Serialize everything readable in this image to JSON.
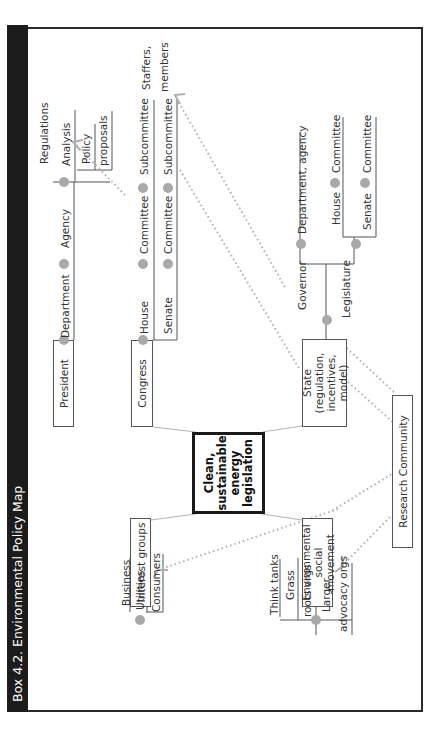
{
  "title": "Box 4.2. Environmental Policy Map",
  "center": {
    "label": "Clean, sustainable energy legislation",
    "lines": [
      "Clean,",
      "sustainable",
      "energy",
      "legislation"
    ]
  },
  "nodes": {
    "president": "President",
    "congress": "Congress",
    "state": {
      "lines": [
        "State (regulation,",
        "incentives,",
        "model)"
      ]
    },
    "interest_groups": "Interest groups",
    "env_movement": {
      "lines": [
        "Environmental",
        "social movement"
      ]
    },
    "research": "Research Community"
  },
  "federal_exec": {
    "department": "Department",
    "agency": "Agency",
    "regulations": "Regulations",
    "analysis": "Analysis",
    "policy_proposals": [
      "Policy",
      "proposals"
    ]
  },
  "congress_branch": {
    "house": "House",
    "senate": "Senate",
    "committee": "Committee",
    "subcommittee": "Subcommittee",
    "staffers": [
      "Staffers,",
      "members"
    ]
  },
  "state_branch": {
    "governor": "Governor",
    "dept_agency": "Department, agency",
    "legislature": "Legislature",
    "house": "House",
    "senate": "Senate",
    "committee": "Committee"
  },
  "interest_children": [
    "Business",
    "Utilities",
    "Consumers"
  ],
  "env_children": {
    "think_tanks": "Think tanks",
    "grass_roots": [
      "Grass",
      "roots orgs"
    ],
    "larger_advocacy": [
      "Larger",
      "advocacy orgs"
    ]
  },
  "colors": {
    "title_bg": "#1c1c1c",
    "dot": "#a9a9a9",
    "dotted_arrow": "#b0b0b0",
    "connector": "#b5b5b5"
  }
}
